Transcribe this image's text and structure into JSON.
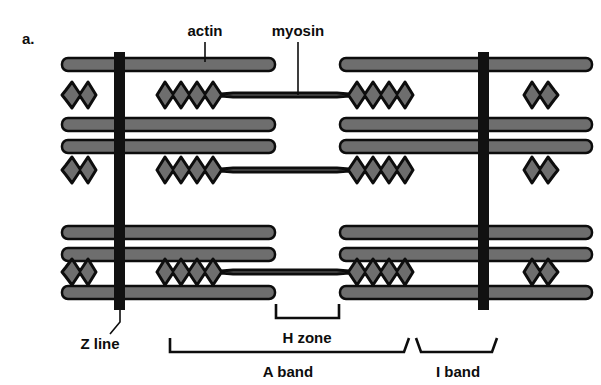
{
  "figure": {
    "panel_label": "a.",
    "title_implicit": "Sarcomere structure (striated muscle myofibril)",
    "background_color": "#ffffff",
    "filament_fill": "#6e6e6e",
    "outline_color": "#0d0d0d",
    "zline_color": "#111111"
  },
  "labels": {
    "actin": "actin",
    "myosin": "myosin",
    "z_line": "Z line",
    "h_zone": "H zone",
    "a_band": "A band",
    "i_band": "I band"
  },
  "geometry": {
    "left_zline_x": 120,
    "right_zline_x": 483,
    "zline_width": 11,
    "zline_top": 52,
    "zline_bottom": 310,
    "actin_left_start": 62,
    "actin_right_end": 592,
    "h_zone_left": 275,
    "h_zone_right": 340,
    "myosin_left_edge": 157,
    "myosin_right_edge": 425,
    "actin_rows_y": [
      64,
      124,
      146,
      186,
      232,
      254,
      292
    ],
    "myosin_rows_y": [
      95,
      170,
      272
    ],
    "band_thickness": 13,
    "myosin_thickness": 30
  },
  "brackets": {
    "h_zone": {
      "x1": 275,
      "x2": 340,
      "y": 318,
      "label_x": 307,
      "label_y": 343
    },
    "a_band": {
      "x1": 170,
      "x2": 405,
      "y": 350,
      "label_x": 288,
      "label_y": 375
    },
    "i_band": {
      "x1": 415,
      "x2": 497,
      "y": 350,
      "label_x": 456,
      "label_y": 375
    }
  },
  "leaders": {
    "actin": {
      "x": 205,
      "y1": 42,
      "y2": 62,
      "label_x": 205,
      "label_y": 36
    },
    "myosin": {
      "x": 298,
      "y1": 42,
      "y2": 92,
      "label_x": 298,
      "label_y": 36
    },
    "z_line": {
      "x1": 120,
      "y1": 310,
      "x2": 108,
      "y2": 330,
      "label_x": 104,
      "label_y": 345
    }
  }
}
